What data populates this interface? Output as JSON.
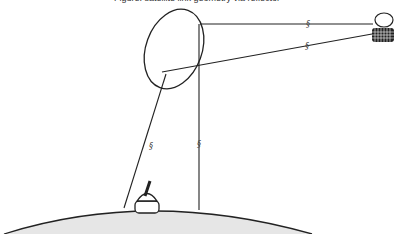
{
  "caption": "Figure: satellite link geometry via reflector",
  "colors": {
    "stroke": "#222222",
    "earth_fill": "#e6e6e6",
    "background": "#ffffff"
  },
  "break_marks": {
    "symbol": "§§",
    "count": 4
  },
  "elements": {
    "reflector": "elliptical reflector",
    "satellite": "satellite",
    "ground_station": "ground station dish",
    "earth": "earth surface arc"
  }
}
